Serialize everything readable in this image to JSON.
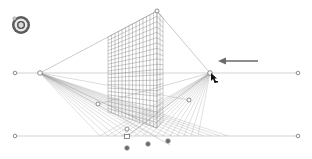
{
  "app": {
    "title": "Perspective Grid"
  },
  "widget": {
    "name": "plane-switching-widget",
    "active_plane": "left"
  },
  "grid": {
    "type": "two-point-perspective",
    "horizon_y": 73,
    "ground_y": 136,
    "left_vanishing_point": [
      40,
      73
    ],
    "right_vanishing_point": [
      210,
      73
    ],
    "vertical_top": [
      157,
      11
    ],
    "apex": [
      127,
      136
    ],
    "line_color": "#9a9a9a",
    "grid_color": "#8c8c8c"
  },
  "annotation": {
    "arrow_direction": "left",
    "arrow_color": "#6a6a6a"
  },
  "handles": {
    "horizon_left_end": [
      15,
      73
    ],
    "horizon_right_end": [
      298,
      73
    ],
    "ground_left_end": [
      15,
      136
    ],
    "ground_right_end": [
      298,
      136
    ],
    "left_extent": [
      98,
      104
    ],
    "right_extent": [
      189,
      100
    ],
    "origin_top": [
      127,
      129
    ],
    "origin": [
      127,
      137
    ],
    "ground_origin": [
      127,
      147
    ],
    "right_plane_control": [
      148,
      142
    ],
    "left_plane_control": [
      168,
      141
    ]
  }
}
